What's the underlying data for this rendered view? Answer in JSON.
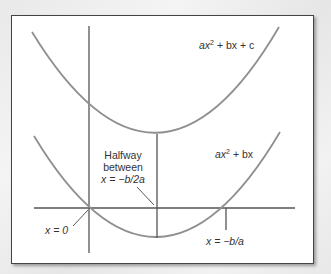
{
  "diagram": {
    "type": "quadratic-parabolas",
    "curves": [
      {
        "id": "upper",
        "label_parts": [
          "ax",
          "2",
          " + bx + c"
        ],
        "label": "ax² + bx + c",
        "vertex": [
          157,
          134
        ],
        "path": "M32,32 Q157,236 279,27"
      },
      {
        "id": "lower",
        "label_parts": [
          "ax",
          "2",
          " + bx"
        ],
        "label": "ax² + bx",
        "vertex": [
          157,
          238
        ],
        "path": "M34,136 Q157,340 280,132"
      }
    ],
    "annotations": {
      "halfway_line1": "Halfway",
      "halfway_line2": "between",
      "halfway_line3": "x = −b/2a",
      "origin": "x = 0",
      "root": "x = −b/a"
    },
    "colors": {
      "curve": "#8f8f8f",
      "axis": "#555555",
      "text": "#333333"
    }
  }
}
